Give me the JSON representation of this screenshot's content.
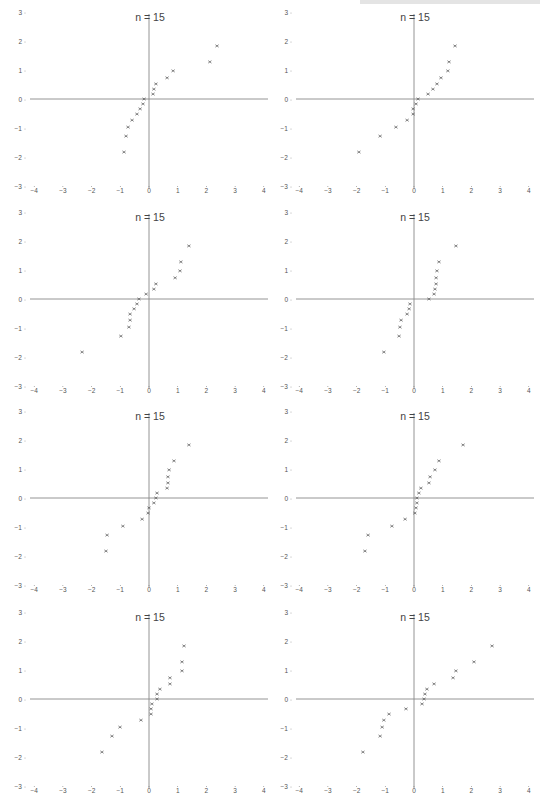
{
  "page": {
    "running_head_visible": true
  },
  "layout": {
    "columns": 2,
    "rows": 4,
    "panel_width": 272,
    "panel_height": 200
  },
  "style": {
    "axis_color": "#888888",
    "marker_color": "#555555",
    "text_color": "#555555",
    "marker": "x"
  },
  "chart_data": [
    {
      "type": "scatter",
      "title": "n = 15",
      "xlim": [
        -4,
        4
      ],
      "ylim": [
        -3,
        3
      ],
      "xticks": [
        -4,
        -3,
        -2,
        -1,
        0,
        1,
        2,
        3,
        4
      ],
      "yticks": [
        -3,
        -2,
        -1,
        0,
        1,
        2,
        3
      ],
      "grid": false,
      "x": [
        2.37,
        2.12,
        0.84,
        0.63,
        0.24,
        0.17,
        0.14,
        -0.17,
        -0.21,
        -0.31,
        -0.42,
        -0.59,
        -0.73,
        -0.8,
        -0.87
      ],
      "y": [
        1.83,
        1.28,
        0.97,
        0.73,
        0.52,
        0.34,
        0.17,
        0,
        -0.17,
        -0.34,
        -0.52,
        -0.73,
        -0.97,
        -1.28,
        -1.83
      ]
    },
    {
      "type": "scatter",
      "title": "n = 15",
      "xlim": [
        -4,
        4
      ],
      "ylim": [
        -3,
        3
      ],
      "xticks": [
        -4,
        -3,
        -2,
        -1,
        0,
        1,
        2,
        3,
        4
      ],
      "yticks": [
        -3,
        -2,
        -1,
        0,
        1,
        2,
        3
      ],
      "grid": false,
      "x": [
        1.43,
        1.22,
        1.18,
        0.94,
        0.8,
        0.66,
        0.49,
        0.14,
        0.07,
        -0.03,
        -0.03,
        -0.24,
        -0.63,
        -1.18,
        -1.92
      ],
      "y": [
        1.83,
        1.28,
        0.97,
        0.73,
        0.52,
        0.34,
        0.17,
        0,
        -0.17,
        -0.34,
        -0.52,
        -0.73,
        -0.97,
        -1.28,
        -1.83
      ]
    },
    {
      "type": "scatter",
      "title": "n = 15",
      "xlim": [
        -4,
        4
      ],
      "ylim": [
        -3,
        3
      ],
      "xticks": [
        -4,
        -3,
        -2,
        -1,
        0,
        1,
        2,
        3,
        4
      ],
      "yticks": [
        -3,
        -2,
        -1,
        0,
        1,
        2,
        3
      ],
      "grid": false,
      "x": [
        1.39,
        1.11,
        1.08,
        0.91,
        0.24,
        0.17,
        -0.1,
        -0.35,
        -0.42,
        -0.52,
        -0.66,
        -0.66,
        -0.7,
        -0.98,
        -2.33
      ],
      "y": [
        1.83,
        1.28,
        0.97,
        0.73,
        0.52,
        0.34,
        0.17,
        0,
        -0.17,
        -0.34,
        -0.52,
        -0.73,
        -0.97,
        -1.28,
        -1.83
      ]
    },
    {
      "type": "scatter",
      "title": "n = 15",
      "xlim": [
        -4,
        4
      ],
      "ylim": [
        -3,
        3
      ],
      "xticks": [
        -4,
        -3,
        -2,
        -1,
        0,
        1,
        2,
        3,
        4
      ],
      "yticks": [
        -3,
        -2,
        -1,
        0,
        1,
        2,
        3
      ],
      "grid": false,
      "x": [
        1.46,
        0.87,
        0.8,
        0.77,
        0.77,
        0.73,
        0.7,
        0.52,
        -0.14,
        -0.17,
        -0.24,
        -0.45,
        -0.49,
        -0.52,
        -1.05
      ],
      "y": [
        1.83,
        1.28,
        0.97,
        0.73,
        0.52,
        0.34,
        0.17,
        0,
        -0.17,
        -0.34,
        -0.52,
        -0.73,
        -0.97,
        -1.28,
        -1.83
      ]
    },
    {
      "type": "scatter",
      "title": "n = 15",
      "xlim": [
        -4,
        4
      ],
      "ylim": [
        -3,
        3
      ],
      "xticks": [
        -4,
        -3,
        -2,
        -1,
        0,
        1,
        2,
        3,
        4
      ],
      "yticks": [
        -3,
        -2,
        -1,
        0,
        1,
        2,
        3
      ],
      "grid": false,
      "x": [
        1.39,
        0.87,
        0.7,
        0.66,
        0.66,
        0.63,
        0.28,
        0.24,
        0.17,
        0.0,
        -0.03,
        -0.24,
        -0.91,
        -1.46,
        -1.5
      ],
      "y": [
        1.83,
        1.28,
        0.97,
        0.73,
        0.52,
        0.34,
        0.17,
        0,
        -0.17,
        -0.34,
        -0.52,
        -0.73,
        -0.97,
        -1.28,
        -1.83
      ]
    },
    {
      "type": "scatter",
      "title": "n = 15",
      "xlim": [
        -4,
        4
      ],
      "ylim": [
        -3,
        3
      ],
      "xticks": [
        -4,
        -3,
        -2,
        -1,
        0,
        1,
        2,
        3,
        4
      ],
      "yticks": [
        -3,
        -2,
        -1,
        0,
        1,
        2,
        3
      ],
      "grid": false,
      "x": [
        1.71,
        0.87,
        0.73,
        0.56,
        0.52,
        0.24,
        0.17,
        0.1,
        0.1,
        0.07,
        0.03,
        -0.31,
        -0.77,
        -1.6,
        -1.71
      ],
      "y": [
        1.83,
        1.28,
        0.97,
        0.73,
        0.52,
        0.34,
        0.17,
        0,
        -0.17,
        -0.34,
        -0.52,
        -0.73,
        -0.97,
        -1.28,
        -1.83
      ]
    },
    {
      "type": "scatter",
      "title": "n = 15",
      "xlim": [
        -4,
        4
      ],
      "ylim": [
        -3,
        3
      ],
      "xticks": [
        -4,
        -3,
        -2,
        -1,
        0,
        1,
        2,
        3,
        4
      ],
      "yticks": [
        -3,
        -2,
        -1,
        0,
        1,
        2,
        3
      ],
      "grid": false,
      "x": [
        1.22,
        1.15,
        1.15,
        0.73,
        0.73,
        0.38,
        0.28,
        0.28,
        0.1,
        0.07,
        0.07,
        -0.28,
        -1.01,
        -1.29,
        -1.64
      ],
      "y": [
        1.83,
        1.28,
        0.97,
        0.73,
        0.52,
        0.34,
        0.17,
        0,
        -0.17,
        -0.34,
        -0.52,
        -0.73,
        -0.97,
        -1.28,
        -1.83
      ]
    },
    {
      "type": "scatter",
      "title": "n = 15",
      "xlim": [
        -4,
        4
      ],
      "ylim": [
        -3,
        3
      ],
      "xticks": [
        -4,
        -3,
        -2,
        -1,
        0,
        1,
        2,
        3,
        4
      ],
      "yticks": [
        -3,
        -2,
        -1,
        0,
        1,
        2,
        3
      ],
      "grid": false,
      "x": [
        2.72,
        2.09,
        1.46,
        1.36,
        0.7,
        0.45,
        0.38,
        0.35,
        0.28,
        -0.28,
        -0.87,
        -1.05,
        -1.11,
        -1.18,
        -1.78
      ],
      "y": [
        1.83,
        1.28,
        0.97,
        0.73,
        0.52,
        0.34,
        0.17,
        0,
        -0.17,
        -0.34,
        -0.52,
        -0.73,
        -0.97,
        -1.28,
        -1.83
      ]
    }
  ]
}
